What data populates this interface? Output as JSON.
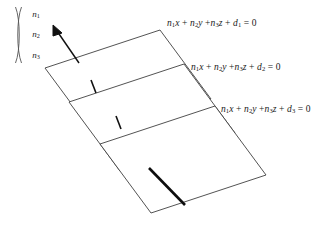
{
  "figure": {
    "background_color": "#ffffff",
    "stroke_color": "#3a3a3a",
    "accent_color": "#000000",
    "width": 335,
    "height": 246
  },
  "normal_vector": {
    "name": "normal-vector-column",
    "components": [
      "n",
      "n",
      "n"
    ],
    "subscripts": [
      "1",
      "2",
      "3"
    ],
    "bracket": "parenthesis",
    "arrow_label": "normal-direction-arrow"
  },
  "planes": [
    {
      "id": "plane-1",
      "equation_parts": {
        "term1": "n",
        "term1_sub": "1",
        "term1_var": "x",
        "term2": "n",
        "term2_sub": "2",
        "term2_var": "y",
        "term3": "n",
        "term3_sub": "3",
        "term3_var": "z",
        "const": "d",
        "const_sub": "1",
        "rhs": "= 0"
      },
      "equation_text": "n1x + n2y + n3z + d1 = 0",
      "polygon": "160,30 45,68 96,137 211,99",
      "tick_mark": "tick-mark-plane-1"
    },
    {
      "id": "plane-2",
      "equation_parts": {
        "term1": "n",
        "term1_sub": "1",
        "term1_var": "x",
        "term2": "n",
        "term2_sub": "2",
        "term2_var": "y",
        "term3": "n",
        "term3_sub": "3",
        "term3_var": "z",
        "const": "d",
        "const_sub": "2",
        "rhs": "= 0"
      },
      "equation_text": "n1x + n2y + n3z + d2 = 0",
      "polygon": "184,64 69,102 120,171 235,133",
      "tick_mark": "tick-mark-plane-2"
    },
    {
      "id": "plane-3",
      "equation_parts": {
        "term1": "n",
        "term1_sub": "1",
        "term1_var": "x",
        "term2": "n",
        "term2_sub": "2",
        "term2_var": "y",
        "term3": "n",
        "term3_sub": "3",
        "term3_var": "z",
        "const": "d",
        "const_sub": "3",
        "rhs": "= 0"
      },
      "equation_text": "n1x + n2y + n3z + d3 = 0",
      "polygon": "215,106 100,144 151,213 266,175",
      "tick_mark": "intersection-line-plane-3"
    }
  ]
}
